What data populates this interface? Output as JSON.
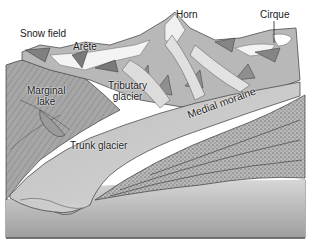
{
  "diagram": {
    "labels": {
      "snow_field": "Snow field",
      "arete": "Arête",
      "horn": "Horn",
      "cirque": "Cirque",
      "marginal_lake": "Marginal\nlake",
      "tributary_glacier": "Tributary\nglacier",
      "medial_moraine": "Medial moraine",
      "trunk_glacier": "Trunk glacier"
    },
    "colors": {
      "ice": "#d9d9d9",
      "rock_dark": "#8a8a8a",
      "rock_mid": "#b0b0b0",
      "snow": "#f4f4f4",
      "moraine": "#a8a8a8",
      "block_front": "#c4c4c4",
      "outline": "#3a3a3a"
    }
  }
}
